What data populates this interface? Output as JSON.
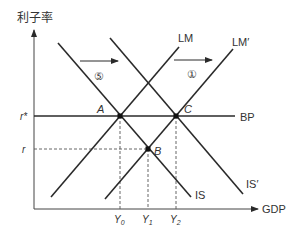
{
  "axes": {
    "y_label": "利子率",
    "x_label": "GDP"
  },
  "curves": {
    "lm": "LM",
    "lm_prime": "LM′",
    "is": "IS",
    "is_prime": "IS′",
    "bp": "BP"
  },
  "points": {
    "a": "A",
    "b": "B",
    "c": "C"
  },
  "rate_labels": {
    "r_star": "r*",
    "r": "r"
  },
  "gdp_labels": {
    "y0": "Y",
    "y0_sub": "0",
    "y1": "Y",
    "y1_sub": "1",
    "y2": "Y",
    "y2_sub": "2"
  },
  "shift_markers": {
    "left": "⑤",
    "right": "①"
  },
  "colors": {
    "line": "#2a2a2a",
    "text": "#333333",
    "dashed": "#555555"
  }
}
